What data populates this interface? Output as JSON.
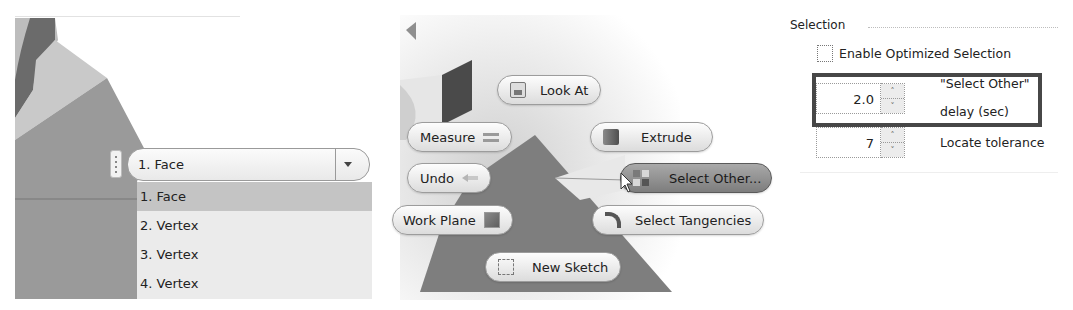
{
  "panel_selection_list": {
    "combo": {
      "value": "1. Face"
    },
    "options": [
      {
        "label": "1. Face",
        "selected": true
      },
      {
        "label": "2. Vertex",
        "selected": false
      },
      {
        "label": "3. Vertex",
        "selected": false
      },
      {
        "label": "4. Vertex",
        "selected": false
      }
    ]
  },
  "panel_marking_menu": {
    "items": {
      "look_at": {
        "label": "Look At",
        "accel": "L",
        "icon": "look-at-icon"
      },
      "measure": {
        "label": "Measure",
        "accel": "M",
        "icon": "measure-icon"
      },
      "extrude": {
        "label": "Extrude",
        "icon": "extrude-icon"
      },
      "undo": {
        "label": "Undo",
        "icon": "undo-icon"
      },
      "select_other": {
        "label": "Select Other...",
        "accel": "O",
        "icon": "select-other-icon",
        "active": true
      },
      "work_plane": {
        "label": "Work Plane",
        "icon": "work-plane-icon"
      },
      "select_tangencies": {
        "label": "Select Tangencies",
        "icon": "select-tangencies-icon"
      },
      "new_sketch": {
        "label": "New Sketch",
        "icon": "new-sketch-icon"
      }
    }
  },
  "panel_options": {
    "group_title": "Selection",
    "enable_optimized": {
      "label": "Enable Optimized Selection",
      "checked": false
    },
    "select_other_delay": {
      "value": "2.0",
      "label_line1": "\"Select Other\"",
      "label_line2": "delay (sec)"
    },
    "locate_tolerance": {
      "value": "7",
      "label": "Locate tolerance"
    },
    "spin_up": "˄",
    "spin_down": "˅"
  }
}
